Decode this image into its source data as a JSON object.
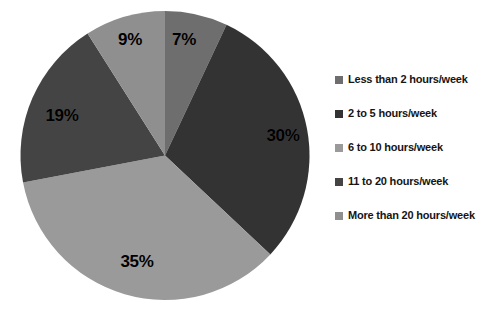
{
  "chart_data": {
    "type": "pie",
    "title": "",
    "categories": [
      "Less than 2 hours/week",
      "2 to 5 hours/week",
      "6 to 10 hours/week",
      "11 to 20 hours/week",
      "More than 20 hours/week"
    ],
    "values": [
      7,
      30,
      35,
      19,
      9
    ],
    "value_labels": [
      "7%",
      "30%",
      "35%",
      "19%",
      "9%"
    ],
    "colors": [
      "#6e6e6e",
      "#333333",
      "#9a9a9a",
      "#444444",
      "#8f8f8f"
    ],
    "units": "percent",
    "start_angle_deg": 0,
    "direction": "clockwise",
    "legend_position": "right",
    "grid": false,
    "xlabel": "",
    "ylabel": ""
  },
  "legend": {
    "items": [
      {
        "label": "Less than 2 hours/week",
        "color": "#6e6e6e"
      },
      {
        "label": "2 to 5 hours/week",
        "color": "#333333"
      },
      {
        "label": "6 to 10 hours/week",
        "color": "#9a9a9a"
      },
      {
        "label": "11 to 20 hours/week",
        "color": "#444444"
      },
      {
        "label": "More than 20 hours/week",
        "color": "#8f8f8f"
      }
    ]
  },
  "slice_labels": [
    {
      "text": "7%",
      "x": 184,
      "y": 40
    },
    {
      "text": "30%",
      "x": 283,
      "y": 136
    },
    {
      "text": "35%",
      "x": 137,
      "y": 262
    },
    {
      "text": "19%",
      "x": 62,
      "y": 116
    },
    {
      "text": "9%",
      "x": 130,
      "y": 40
    }
  ]
}
